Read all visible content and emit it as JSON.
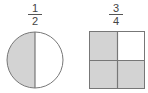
{
  "figures": [
    {
      "shape": "circle",
      "fraction": {
        "numerator": "1",
        "denominator": "2"
      },
      "parts": 2,
      "shaded_parts": 1,
      "shaded": "left half"
    },
    {
      "shape": "square",
      "fraction": {
        "numerator": "3",
        "denominator": "4"
      },
      "parts": 4,
      "shaded_parts": 3,
      "shaded": "top-left, bottom-left, bottom-right"
    }
  ],
  "colors": {
    "shade": "#d3d3d3",
    "stroke": "#777777",
    "background": "#ffffff"
  }
}
